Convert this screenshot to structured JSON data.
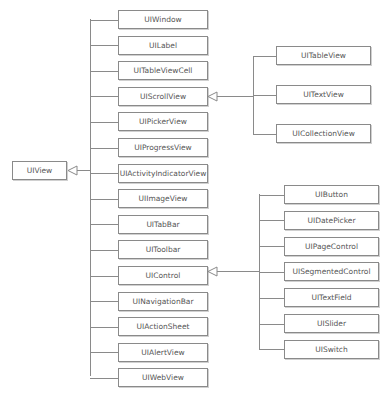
{
  "diagram": {
    "type": "class-inheritance-tree",
    "root": {
      "label": "UIView"
    },
    "children": [
      {
        "label": "UIWindow"
      },
      {
        "label": "UILabel"
      },
      {
        "label": "UITableViewCell"
      },
      {
        "label": "UIScrollView"
      },
      {
        "label": "UIPickerView"
      },
      {
        "label": "UIProgressView"
      },
      {
        "label": "UIActivityIndicatorView"
      },
      {
        "label": "UIImageView"
      },
      {
        "label": "UITabBar"
      },
      {
        "label": "UIToolbar"
      },
      {
        "label": "UIControl"
      },
      {
        "label": "UINavigationBar"
      },
      {
        "label": "UIActionSheet"
      },
      {
        "label": "UIAlertView"
      },
      {
        "label": "UIWebView"
      }
    ],
    "scrollview_children": [
      {
        "label": "UITableView"
      },
      {
        "label": "UITextView"
      },
      {
        "label": "UICollectionView"
      }
    ],
    "control_children": [
      {
        "label": "UIButton"
      },
      {
        "label": "UIDatePicker"
      },
      {
        "label": "UIPageControl"
      },
      {
        "label": "UISegmentedControl"
      },
      {
        "label": "UITextField"
      },
      {
        "label": "UISlider"
      },
      {
        "label": "UISwitch"
      }
    ],
    "colors": {
      "line": "#8a8a8a",
      "text": "#555555",
      "background": "#ffffff"
    }
  }
}
